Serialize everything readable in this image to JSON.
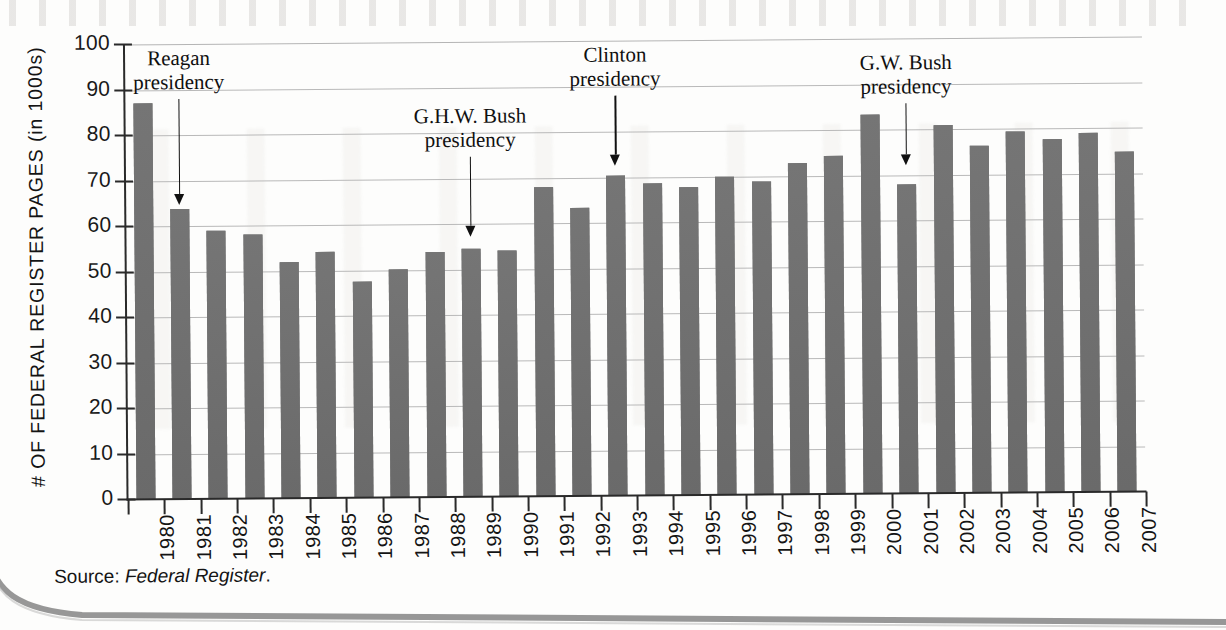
{
  "chart_data": {
    "type": "bar",
    "title": "",
    "xlabel": "",
    "ylabel": "# OF FEDERAL REGISTER PAGES (in 1000s)",
    "ylim": [
      0,
      100
    ],
    "ytick_labels": [
      "100",
      "90",
      "80",
      "70",
      "60",
      "50",
      "40",
      "30",
      "20",
      "10",
      "0"
    ],
    "ytick_values": [
      100,
      90,
      80,
      70,
      60,
      50,
      40,
      30,
      20,
      10,
      0
    ],
    "grid": true,
    "legend": "none",
    "bar_color": "#6e6e6e",
    "categories": [
      "1980",
      "1981",
      "1982",
      "1983",
      "1984",
      "1985",
      "1986",
      "1987",
      "1988",
      "1989",
      "1990",
      "1991",
      "1992",
      "1993",
      "1994",
      "1995",
      "1996",
      "1997",
      "1998",
      "1999",
      "2000",
      "2001",
      "2002",
      "2003",
      "2004",
      "2005",
      "2006",
      "2007"
    ],
    "values": [
      87.0,
      63.8,
      59.0,
      58.0,
      51.8,
      54.0,
      47.5,
      50.2,
      53.8,
      54.5,
      54.0,
      68.0,
      63.2,
      70.4,
      68.5,
      67.8,
      70.0,
      68.8,
      72.8,
      74.2,
      83.3,
      68.0,
      80.8,
      76.3,
      79.3,
      77.6,
      78.8,
      74.8
    ],
    "annotations": [
      {
        "label_line1": "Reagan",
        "label_line2": "presidency",
        "target_category": "1981"
      },
      {
        "label_line1": "G.H.W. Bush",
        "label_line2": "presidency",
        "target_category": "1989"
      },
      {
        "label_line1": "Clinton",
        "label_line2": "presidency",
        "target_category": "1993"
      },
      {
        "label_line1": "G.W. Bush",
        "label_line2": "presidency",
        "target_category": "2001"
      }
    ]
  },
  "source": {
    "prefix": "Source: ",
    "italic": "Federal Register",
    "suffix": "."
  }
}
